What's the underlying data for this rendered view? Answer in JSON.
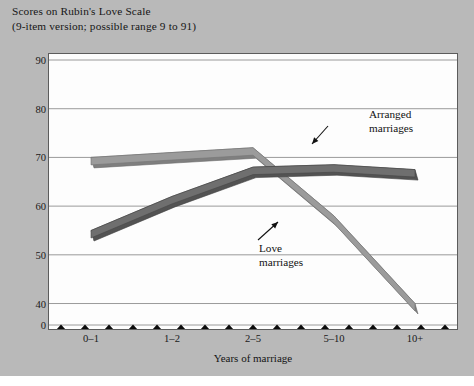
{
  "figure": {
    "title_line1": "Scores on Rubin's Love Scale",
    "title_line2": "(9-item version; possible range 9 to 91)",
    "background_color": "#b9b9b9",
    "plot_background_color": "#fdfdfd",
    "frame_color": "#5c5c5c",
    "gridline_color": "#8e8e8e"
  },
  "annotations": {
    "arranged": {
      "line1": "Arranged",
      "line2": "marriages"
    },
    "love": {
      "line1": "Love",
      "line2": "marriages"
    }
  },
  "axis_break": {
    "name": "axis-break-zigzag",
    "color": "#0b0b0b",
    "teeth": 17,
    "value_low": 0,
    "value_high": 40
  },
  "chart_data": {
    "type": "line",
    "title": "Scores on Rubin's Love Scale (9-item version; possible range 9 to 91)",
    "xlabel": "Years of marriage",
    "ylabel": "",
    "categories": [
      "0–1",
      "1–2",
      "2–5",
      "5–10",
      "10+"
    ],
    "yticks": [
      90,
      80,
      70,
      60,
      50,
      40,
      0
    ],
    "ylim": [
      0,
      90
    ],
    "y_axis_broken": true,
    "y_axis_break_between": [
      0,
      40
    ],
    "grid": "horizontal",
    "legend": "annotated-inline",
    "series": [
      {
        "name": "Love marriages",
        "color": "#9b9b9b",
        "values": [
          70,
          71,
          72,
          58,
          40
        ]
      },
      {
        "name": "Arranged marriages",
        "color": "#6f6f6f",
        "values": [
          55,
          62,
          68,
          68.5,
          67.5
        ]
      }
    ]
  }
}
